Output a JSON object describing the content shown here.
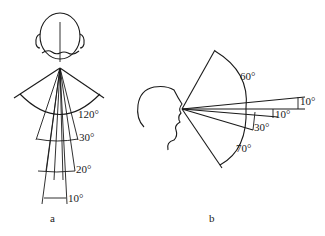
{
  "figure_a": {
    "label": "a",
    "view": "front view of head",
    "angles": [
      {
        "value": "120°"
      },
      {
        "value": "30°"
      },
      {
        "value": "20°"
      },
      {
        "value": "10°"
      }
    ]
  },
  "figure_b": {
    "label": "b",
    "view": "side profile of head",
    "angles": [
      {
        "value": "60°"
      },
      {
        "value": "10°"
      },
      {
        "value": "10°"
      },
      {
        "value": "30°"
      },
      {
        "value": "70°"
      }
    ]
  },
  "colors": {
    "line": "#1a1a1a",
    "background": "#ffffff"
  }
}
